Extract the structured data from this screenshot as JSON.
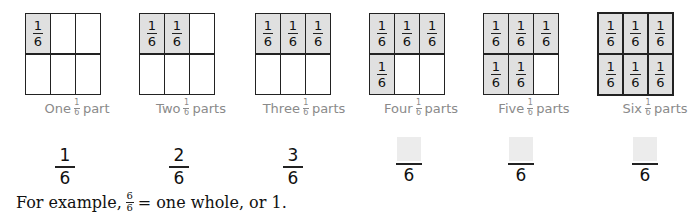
{
  "colors": {
    "shaded_cell": "#e0e0e0",
    "grid_line": "#222222",
    "label_text": "#8a8a8a",
    "blank_box": "#ececec"
  },
  "cell_fraction": {
    "numerator": "1",
    "denominator": "6"
  },
  "panels": [
    {
      "shaded_count": 1,
      "label_before": "One",
      "label_after": "part",
      "label_fraction": {
        "numerator": "1",
        "denominator": "6"
      },
      "answer": {
        "numerator": "1",
        "denominator": "6",
        "blank": false
      }
    },
    {
      "shaded_count": 2,
      "label_before": "Two",
      "label_after": "parts",
      "label_fraction": {
        "numerator": "1",
        "denominator": "6"
      },
      "answer": {
        "numerator": "2",
        "denominator": "6",
        "blank": false
      }
    },
    {
      "shaded_count": 3,
      "label_before": "Three",
      "label_after": "parts",
      "label_fraction": {
        "numerator": "1",
        "denominator": "6"
      },
      "answer": {
        "numerator": "3",
        "denominator": "6",
        "blank": false
      }
    },
    {
      "shaded_count": 4,
      "label_before": "Four",
      "label_after": "parts",
      "label_fraction": {
        "numerator": "1",
        "denominator": "6"
      },
      "answer": {
        "numerator": "",
        "denominator": "6",
        "blank": true
      }
    },
    {
      "shaded_count": 5,
      "label_before": "Five",
      "label_after": "parts",
      "label_fraction": {
        "numerator": "1",
        "denominator": "6"
      },
      "answer": {
        "numerator": "",
        "denominator": "6",
        "blank": true
      }
    },
    {
      "shaded_count": 6,
      "label_before": "Six",
      "label_after": "parts",
      "label_fraction": {
        "numerator": "1",
        "denominator": "6"
      },
      "answer": {
        "numerator": "",
        "denominator": "6",
        "blank": true
      }
    }
  ],
  "sentence": {
    "before": "For example,",
    "fraction": {
      "numerator": "6",
      "denominator": "6"
    },
    "after": "= one whole, or 1."
  }
}
